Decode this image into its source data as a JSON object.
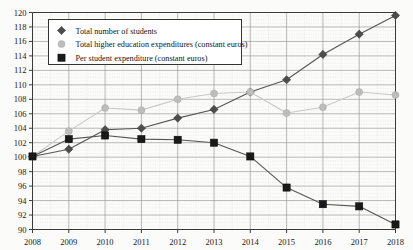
{
  "chart_data": {
    "type": "line",
    "title": "",
    "xlabel": "",
    "ylabel": "",
    "categories": [
      "2008",
      "2009",
      "2010",
      "2011",
      "2012",
      "2013",
      "2014",
      "2015",
      "2016",
      "2017",
      "2018"
    ],
    "x": [
      2008,
      2009,
      2010,
      2011,
      2012,
      2013,
      2014,
      2015,
      2016,
      2017,
      2018
    ],
    "ylim": [
      90,
      120
    ],
    "xlim": [
      2008,
      2018
    ],
    "yticks": [
      90,
      92,
      94,
      96,
      98,
      100,
      102,
      104,
      106,
      108,
      110,
      112,
      114,
      116,
      118,
      120
    ],
    "ytick_labels": [
      "90",
      "92",
      "94",
      "96",
      "98",
      "100",
      "102",
      "104",
      "106",
      "108",
      "110",
      "112",
      "114",
      "116",
      "118",
      "120"
    ],
    "ytick_step": 2,
    "grid": true,
    "grid_minor": true,
    "legend_position": "top-left",
    "series": [
      {
        "name": "Total number of students",
        "marker": "diamond",
        "color": "#4d4d4d",
        "values": [
          100.1,
          101.1,
          103.8,
          104.0,
          105.4,
          106.6,
          109.0,
          110.7,
          114.2,
          117.0,
          119.6
        ]
      },
      {
        "name": "Total higher education expenditures (constant euros)",
        "marker": "circle",
        "color": "#bdbdbd",
        "values": [
          100.1,
          103.6,
          106.8,
          106.5,
          108.0,
          108.8,
          109.0,
          106.1,
          106.9,
          109.0,
          108.6
        ]
      },
      {
        "name": "Per student expenditure (constant euros)",
        "marker": "square",
        "color": "#1a1a1a",
        "values": [
          100.1,
          102.5,
          103.0,
          102.5,
          102.4,
          102.0,
          100.1,
          95.8,
          93.5,
          93.2,
          90.7
        ]
      }
    ]
  },
  "legend": {
    "items": [
      {
        "label": "Total number of students",
        "marker": "diamond",
        "color": "#4d4d4d"
      },
      {
        "label": "Total higher education expenditures (constant euros)",
        "marker": "circle",
        "color": "#bdbdbd"
      },
      {
        "label": "Per student expenditure (constant euros)",
        "marker": "square",
        "color": "#1a1a1a"
      }
    ]
  }
}
